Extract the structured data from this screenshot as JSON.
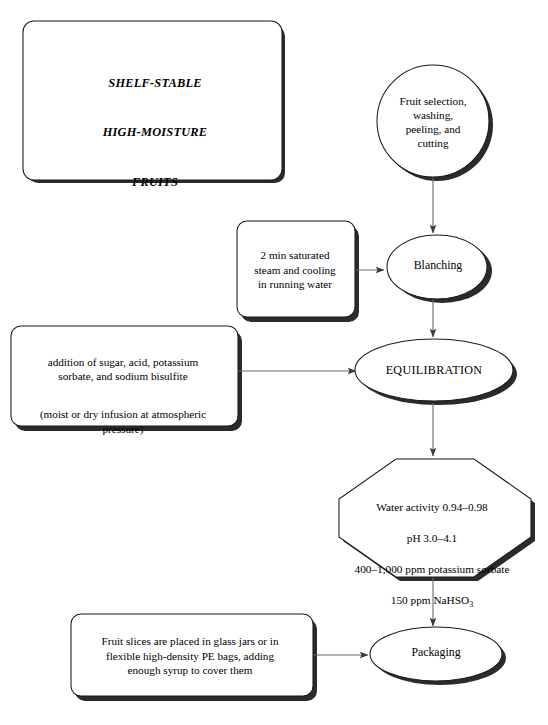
{
  "diagram": {
    "title_panel": {
      "line1": "SHELF-STABLE",
      "line2": "HIGH-MOISTURE",
      "line3": "FRUITS"
    },
    "nodes": {
      "fruit_selection": "Fruit selection,\nwashing,\npeeling, and\ncutting",
      "blanching_treatment": "2 min saturated\nsteam and cooling\nin running water",
      "blanching": "Blanching",
      "additions_main": "addition of sugar, acid, potassium\nsorbate, and sodium bisulfite",
      "additions_note": "(moist or dry infusion at atmospheric\npressure)",
      "equilibration": "EQUILIBRATION",
      "specs_line1": "Water activity 0.94–0.98",
      "specs_line2": "pH 3.0–4.1",
      "specs_line3": "400–1,000 ppm potassium sorbate",
      "specs_line4_pre": "150 ppm NaHSO",
      "specs_line4_sub": "3",
      "packaging_detail": "Fruit slices are placed in glass jars or in\nflexible high-density PE bags, adding\nenough syrup to cover them",
      "packaging": "Packaging"
    },
    "colors": {
      "stroke": "#1a1a1a",
      "shadow": "#2b2b2b",
      "fill": "#ffffff",
      "connector": "#5a5a5a",
      "background": "#ffffff"
    }
  }
}
